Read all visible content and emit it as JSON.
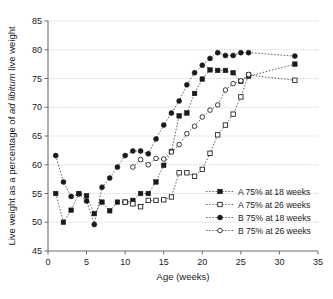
{
  "chart_data": {
    "type": "line",
    "title": "",
    "subtitle": "",
    "xlabel": "Age (weeks)",
    "ylabel": "Live weight as a percentage of ad libitum live weight",
    "ylabel_parts": [
      {
        "text": "Live weight as a percentage of ",
        "style": "normal"
      },
      {
        "text": "ad libitum",
        "style": "italic"
      },
      {
        "text": " live weight",
        "style": "normal"
      }
    ],
    "xlim": [
      0,
      35
    ],
    "ylim": [
      45,
      85
    ],
    "xticks": [
      0,
      5,
      10,
      15,
      20,
      25,
      30,
      35
    ],
    "yticks": [
      45,
      50,
      55,
      60,
      65,
      70,
      75,
      80,
      85
    ],
    "xtick_labels": [
      "0",
      "5",
      "10",
      "15",
      "20",
      "25",
      "30",
      "35"
    ],
    "ytick_labels": [
      "45",
      "50",
      "55",
      "60",
      "65",
      "70",
      "75",
      "80",
      "85"
    ],
    "grid": "horizontal",
    "legend_position": "inside-bottom-right",
    "line_style": "dotted",
    "series": [
      {
        "name": "A 75% at 18 weeks",
        "marker": "filled-square",
        "color": "#1a1a1a",
        "points": [
          {
            "x": 1,
            "y": 55.0
          },
          {
            "x": 2,
            "y": 50.0
          },
          {
            "x": 3,
            "y": 52.1
          },
          {
            "x": 4,
            "y": 55.0
          },
          {
            "x": 5,
            "y": 54.6
          },
          {
            "x": 6,
            "y": 51.5
          },
          {
            "x": 7,
            "y": 53.5
          },
          {
            "x": 8,
            "y": 52.0
          },
          {
            "x": 9,
            "y": 53.5
          },
          {
            "x": 10,
            "y": 53.5
          },
          {
            "x": 11,
            "y": 53.8
          },
          {
            "x": 12,
            "y": 55.0
          },
          {
            "x": 13,
            "y": 55.0
          },
          {
            "x": 14,
            "y": 57.0
          },
          {
            "x": 15,
            "y": 59.9
          },
          {
            "x": 16,
            "y": 62.3
          },
          {
            "x": 17,
            "y": 68.5
          },
          {
            "x": 18,
            "y": 69.0
          },
          {
            "x": 19,
            "y": 72.4
          },
          {
            "x": 20,
            "y": 74.9
          },
          {
            "x": 21,
            "y": 76.5
          },
          {
            "x": 22,
            "y": 76.4
          },
          {
            "x": 23,
            "y": 76.4
          },
          {
            "x": 24,
            "y": 76.0
          },
          {
            "x": 25,
            "y": 74.5
          },
          {
            "x": 26,
            "y": 75.4
          },
          {
            "x": 32,
            "y": 77.5
          }
        ]
      },
      {
        "name": "A 75% at 26 weeks",
        "marker": "open-square",
        "color": "#1a1a1a",
        "points": [
          {
            "x": 10,
            "y": 53.5
          },
          {
            "x": 11,
            "y": 53.2
          },
          {
            "x": 12,
            "y": 52.7
          },
          {
            "x": 13,
            "y": 53.8
          },
          {
            "x": 14,
            "y": 53.8
          },
          {
            "x": 15,
            "y": 53.9
          },
          {
            "x": 16,
            "y": 54.4
          },
          {
            "x": 17,
            "y": 58.6
          },
          {
            "x": 18,
            "y": 58.6
          },
          {
            "x": 19,
            "y": 58.0
          },
          {
            "x": 20,
            "y": 59.2
          },
          {
            "x": 21,
            "y": 62.0
          },
          {
            "x": 22,
            "y": 65.2
          },
          {
            "x": 23,
            "y": 66.9
          },
          {
            "x": 24,
            "y": 68.8
          },
          {
            "x": 25,
            "y": 71.8
          },
          {
            "x": 26,
            "y": 75.6
          },
          {
            "x": 32,
            "y": 74.7
          }
        ]
      },
      {
        "name": "B 75% at 18 weeks",
        "marker": "filled-circle",
        "color": "#1a1a1a",
        "points": [
          {
            "x": 1,
            "y": 61.6
          },
          {
            "x": 2,
            "y": 57.0
          },
          {
            "x": 3,
            "y": 54.5
          },
          {
            "x": 4,
            "y": 54.9
          },
          {
            "x": 5,
            "y": 53.7
          },
          {
            "x": 6,
            "y": 49.6
          },
          {
            "x": 7,
            "y": 56.1
          },
          {
            "x": 8,
            "y": 57.7
          },
          {
            "x": 9,
            "y": 59.6
          },
          {
            "x": 10,
            "y": 61.6
          },
          {
            "x": 11,
            "y": 62.4
          },
          {
            "x": 12,
            "y": 62.4
          },
          {
            "x": 13,
            "y": 61.9
          },
          {
            "x": 14,
            "y": 64.5
          },
          {
            "x": 15,
            "y": 66.9
          },
          {
            "x": 16,
            "y": 69.0
          },
          {
            "x": 17,
            "y": 71.1
          },
          {
            "x": 18,
            "y": 73.9
          },
          {
            "x": 19,
            "y": 76.0
          },
          {
            "x": 20,
            "y": 77.3
          },
          {
            "x": 21,
            "y": 78.5
          },
          {
            "x": 22,
            "y": 79.5
          },
          {
            "x": 23,
            "y": 79.0
          },
          {
            "x": 24,
            "y": 79.0
          },
          {
            "x": 25,
            "y": 79.5
          },
          {
            "x": 26,
            "y": 79.5
          },
          {
            "x": 32,
            "y": 78.9
          }
        ]
      },
      {
        "name": "B 75% at 26 weeks",
        "marker": "open-circle",
        "color": "#1a1a1a",
        "points": [
          {
            "x": 11,
            "y": 59.6
          },
          {
            "x": 12,
            "y": 60.9
          },
          {
            "x": 13,
            "y": 60.0
          },
          {
            "x": 14,
            "y": 61.1
          },
          {
            "x": 15,
            "y": 61.0
          },
          {
            "x": 16,
            "y": 62.2
          },
          {
            "x": 17,
            "y": 63.5
          },
          {
            "x": 18,
            "y": 65.4
          },
          {
            "x": 19,
            "y": 66.7
          },
          {
            "x": 20,
            "y": 68.3
          },
          {
            "x": 21,
            "y": 69.5
          },
          {
            "x": 22,
            "y": 70.4
          },
          {
            "x": 23,
            "y": 73.0
          },
          {
            "x": 24,
            "y": 74.1
          },
          {
            "x": 25,
            "y": 74.6
          },
          {
            "x": 26,
            "y": 75.7
          }
        ]
      }
    ]
  },
  "legend": {
    "entries": [
      {
        "label": "A 75% at 18 weeks",
        "marker": "filled-square"
      },
      {
        "label": "A 75% at 26 weeks",
        "marker": "open-square"
      },
      {
        "label": "B 75% at 18 weeks",
        "marker": "filled-circle"
      },
      {
        "label": "B 75% at 26 weeks",
        "marker": "open-circle"
      }
    ]
  }
}
